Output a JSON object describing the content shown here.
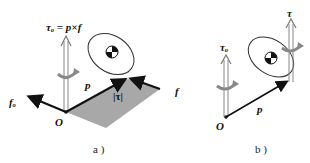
{
  "figure": {
    "panel_a": {
      "caption": "a )",
      "labels": {
        "tau_o_eq": "τₒ = p×f",
        "f_o": "fₒ",
        "p": "p",
        "tau_mag": "|τ|",
        "f": "f",
        "origin": "O"
      }
    },
    "panel_b": {
      "caption": "b )",
      "labels": {
        "tau_o": "τₒ",
        "tau": "τ",
        "p": "p",
        "origin": "O"
      }
    },
    "colors": {
      "parallelogram_fill": "#a8a8a8",
      "vector": "#111111",
      "torque_arrow": "#888888",
      "ellipse": "#333333"
    }
  }
}
